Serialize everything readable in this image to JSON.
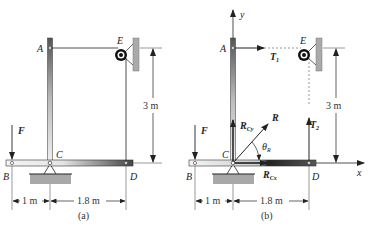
{
  "figure": {
    "panels": [
      {
        "caption": "(a)",
        "points": {
          "A": "A",
          "B": "B",
          "C": "C",
          "D": "D",
          "E": "E"
        },
        "force": "F",
        "dims": {
          "left": "1 m",
          "right": "1.8 m",
          "height": "3 m"
        }
      },
      {
        "caption": "(b)",
        "points": {
          "A": "A",
          "B": "B",
          "C": "C",
          "D": "D",
          "E": "E"
        },
        "force": "F",
        "axes": {
          "x": "x",
          "y": "y"
        },
        "forces": {
          "T1": "T",
          "T1_sub": "1",
          "T2": "T",
          "T2_sub": "2",
          "R": "R",
          "RCx": "R",
          "RCx_sub": "Cx",
          "RCy": "R",
          "RCy_sub": "Cy",
          "theta": "θ",
          "theta_sub": "R"
        },
        "dims": {
          "left": "1 m",
          "right": "1.8 m",
          "height": "3 m"
        }
      }
    ]
  },
  "colors": {
    "line": "#222222",
    "rod_dark": "#444444",
    "rod_light": "#dddddd",
    "wall": "#aaaaaa",
    "support": "#a8a8a8",
    "dash": "#555555"
  }
}
